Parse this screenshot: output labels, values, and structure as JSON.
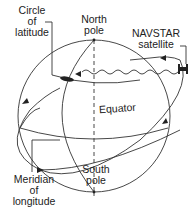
{
  "labels": {
    "circle_of_latitude": [
      "Circle",
      "of",
      "latitude"
    ],
    "north_pole": [
      "North",
      "pole"
    ],
    "navstar_satellite": [
      "NAVSTAR",
      "satellite"
    ],
    "equator": "Equator",
    "south_pole": [
      "South",
      "pole"
    ],
    "meridian_of_longitude": [
      "Meridian",
      "of",
      "longitude"
    ]
  },
  "colors": {
    "line": "#333333",
    "text": "#222222",
    "background": "#ffffff"
  }
}
